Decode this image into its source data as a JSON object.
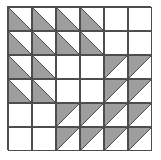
{
  "figure": {
    "type": "geometric-grid-diagram",
    "grid": {
      "rows": 6,
      "cols": 6,
      "cell_size_px": 24
    },
    "colors": {
      "fill": "#9e9e9e",
      "empty": "#ffffff",
      "stroke": "#4d4d4d",
      "background": "#ffffff"
    },
    "legend": {
      "empty_label": "empty",
      "lower_left_label": "lower-left shaded triangle",
      "upper_left_label": "upper-left shaded triangle"
    },
    "cells": [
      [
        "ll",
        "ll",
        "ll",
        "ll",
        "",
        ""
      ],
      [
        "ll",
        "ll",
        "ll",
        "ll",
        "",
        ""
      ],
      [
        "ll",
        "ll",
        "",
        "",
        "ul",
        "ul"
      ],
      [
        "ll",
        "ll",
        "",
        "",
        "ul",
        "ul"
      ],
      [
        "",
        "",
        "ul",
        "ul",
        "ul",
        "ul"
      ],
      [
        "",
        "",
        "ul",
        "ul",
        "ul",
        "ul"
      ]
    ]
  }
}
